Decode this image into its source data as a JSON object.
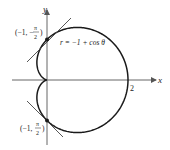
{
  "figure": {
    "equation_label": "r = −1 + cos θ",
    "x_axis_label": "x",
    "y_axis_label": "y",
    "x_tick_label": "2",
    "point_top": {
      "label_open": "(−1, −",
      "label_pi": "π",
      "label_den": "2",
      "label_close": ")"
    },
    "point_bottom": {
      "label_open": "(−1, ",
      "label_pi": "π",
      "label_den": "2",
      "label_close": ")"
    },
    "colors": {
      "curve": "#1a1a1a",
      "axes": "#555555",
      "tangent": "#444444"
    }
  },
  "chart_data": {
    "type": "polar-curve",
    "equation": "r = -1 + cos(theta)",
    "points": [
      {
        "r": -1,
        "theta": "-pi/2",
        "cartesian": [
          0,
          1
        ]
      },
      {
        "r": -1,
        "theta": "pi/2",
        "cartesian": [
          0,
          -1
        ]
      }
    ],
    "tangent_lines_at_points": true,
    "x_tick": 2,
    "axes": [
      "x",
      "y"
    ]
  }
}
